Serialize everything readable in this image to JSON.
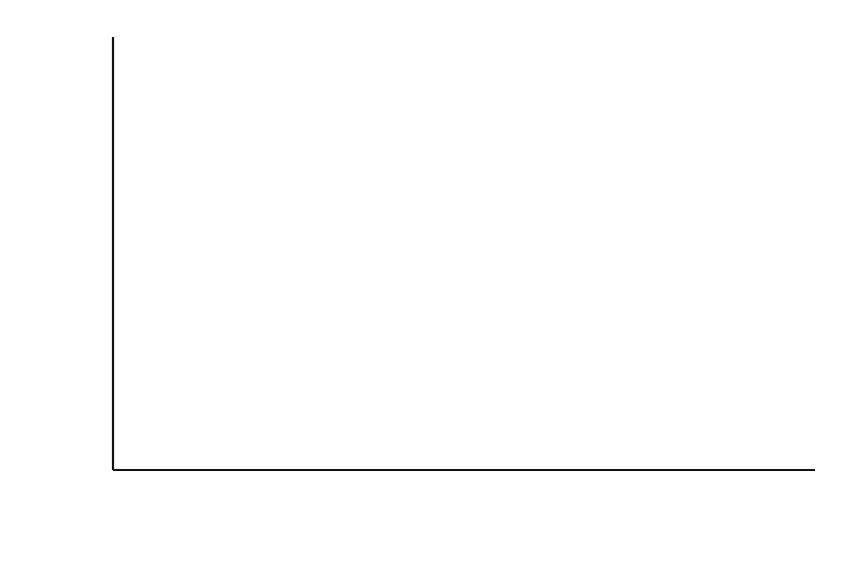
{
  "chart_data": {
    "type": "area",
    "stacked": true,
    "title": "",
    "xlabel": "",
    "ylabel": "Pence/KWh",
    "ylim": [
      0,
      1.2
    ],
    "yticks": [
      0,
      0.2,
      0.4,
      0.6,
      0.8,
      1,
      1.2
    ],
    "ytick_labels": [
      "0",
      "0.2",
      "0.4",
      "0.6",
      "0.8",
      "1",
      "1.2"
    ],
    "grid": false,
    "legend": "none",
    "x": [
      "2000 Q1",
      "2000 Q2",
      "2000 Q3",
      "2000 Q4",
      "2001 Q1",
      "2001 Q2",
      "2001 Q3",
      "2001 Q4",
      "2002 Q1",
      "2002 Q2",
      "2002 Q3",
      "2002 Q4",
      "2003 Q1",
      "2003 Q2",
      "2003 Q3",
      "2003 Q4",
      "2004 Q1"
    ],
    "xtick_labels": [
      "2000 Q1",
      "",
      "2000 Q3",
      "",
      "2001 Q1",
      "",
      "2001 Q3",
      "",
      "2002 Q1",
      "",
      "2002 Q3",
      "",
      "2003 Q1",
      "",
      "2003 Q3",
      "",
      "2004 Q1"
    ],
    "series": [
      {
        "name": "lower-series",
        "color": "#7a7a7a",
        "values": [
          0.49,
          0.46,
          0.47,
          0.7,
          0.72,
          0.6,
          0.56,
          0.68,
          0.7,
          0.55,
          0.52,
          0.62,
          0.63,
          0.57,
          0.54,
          0.66,
          0.63
        ]
      },
      {
        "name": "upper-series",
        "color": "#0d0d0d",
        "values": [
          0.12,
          0.12,
          0.12,
          0.15,
          0.19,
          0.22,
          0.06,
          0.08,
          0.22,
          0.37,
          0.27,
          0.24,
          0.3,
          0.22,
          0.21,
          0.22,
          0.38
        ]
      }
    ],
    "cumulative_top": [
      0.61,
      0.58,
      0.59,
      0.85,
      0.91,
      0.82,
      0.62,
      0.76,
      0.92,
      0.92,
      0.79,
      0.86,
      0.93,
      0.79,
      0.75,
      0.88,
      1.01
    ]
  },
  "axis": {
    "ylabel": "Pence/KWh"
  }
}
